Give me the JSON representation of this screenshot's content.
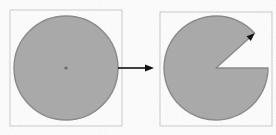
{
  "figure": {
    "caption": "",
    "background_color": "#fbfbfb",
    "paper_texture": "scanned-paper-noise",
    "width": 276,
    "height": 135
  },
  "style": {
    "shape_fill": "#a9a9a9",
    "shape_stroke": "#8a8a8a",
    "box_stroke": "#c9c9c9",
    "arrow_color": "#111111",
    "center_dot_color": "#6b6b6b"
  },
  "panels": [
    {
      "id": "left-panel",
      "label": "full disc",
      "box": {
        "x": 10,
        "y": 10,
        "width": 112,
        "height": 116
      },
      "shape": {
        "type": "disc",
        "center_x": 66,
        "center_y": 68,
        "radius": 52,
        "start_angle_deg": 0,
        "sweep_deg": 360,
        "has_center_dot": true,
        "center_dot_radius": 1.6
      }
    },
    {
      "id": "right-panel",
      "label": "disc with sector removed",
      "box": {
        "x": 160,
        "y": 12,
        "width": 112,
        "height": 114
      },
      "shape": {
        "type": "sector-removed-disc",
        "center_x": 216,
        "center_y": 68,
        "radius": 52,
        "cut_start_angle_deg": -42,
        "cut_end_angle_deg": 0,
        "cut_sweep_deg": 42,
        "has_center_dot": false,
        "angle_marker_arrowhead": true
      }
    }
  ],
  "transition_arrow": {
    "id": "transition-arrow",
    "label": "transforms into",
    "x1": 118,
    "y1": 68,
    "x2": 154,
    "y2": 68,
    "direction": "right",
    "head_length": 9,
    "head_width": 7
  },
  "chart_data": {
    "type": "pie",
    "title": "",
    "categories": [
      "remaining sector",
      "removed wedge"
    ],
    "values": [
      318,
      42
    ],
    "units": "degrees"
  }
}
